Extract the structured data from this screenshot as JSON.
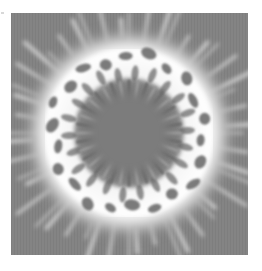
{
  "image": {
    "description": "Grayscale radial interference pattern: a bright white irregular ring of cell-like lobes surrounding a darker gray center, with soft white streaks radiating outward onto a medium-gray background",
    "colors": {
      "page_background": "#ffffff",
      "field_gray": "#848484",
      "center_gray": "#7a7a7a",
      "ring_white": "#ffffff",
      "lobe_dark": "#5a5a5a"
    },
    "ring": {
      "center_x": 118,
      "center_y": 120,
      "inner_radius": 48,
      "outer_radius": 92,
      "lobe_count": 22
    }
  }
}
